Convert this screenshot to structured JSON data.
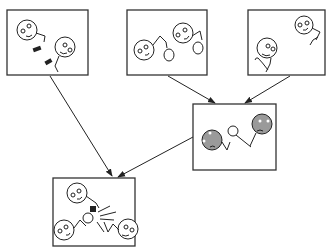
{
  "diagram": {
    "title": "",
    "panels": [
      {
        "id": "panel-1",
        "description": "two figures with hammer and chisel tools"
      },
      {
        "id": "panel-2",
        "description": "two figures with fists raised"
      },
      {
        "id": "panel-3",
        "description": "two figures with hooks"
      },
      {
        "id": "panel-4",
        "description": "two sad gray figures fighting"
      },
      {
        "id": "panel-5",
        "description": "three figures in conflict with impact"
      }
    ],
    "arrows": [
      {
        "from": "panel-1",
        "to": "panel-5"
      },
      {
        "from": "panel-2",
        "to": "panel-4"
      },
      {
        "from": "panel-3",
        "to": "panel-4"
      },
      {
        "from": "panel-4",
        "to": "panel-5"
      }
    ],
    "colors": {
      "line": "#222222",
      "sad_face": "#9a9a9a",
      "background": "#ffffff"
    }
  }
}
